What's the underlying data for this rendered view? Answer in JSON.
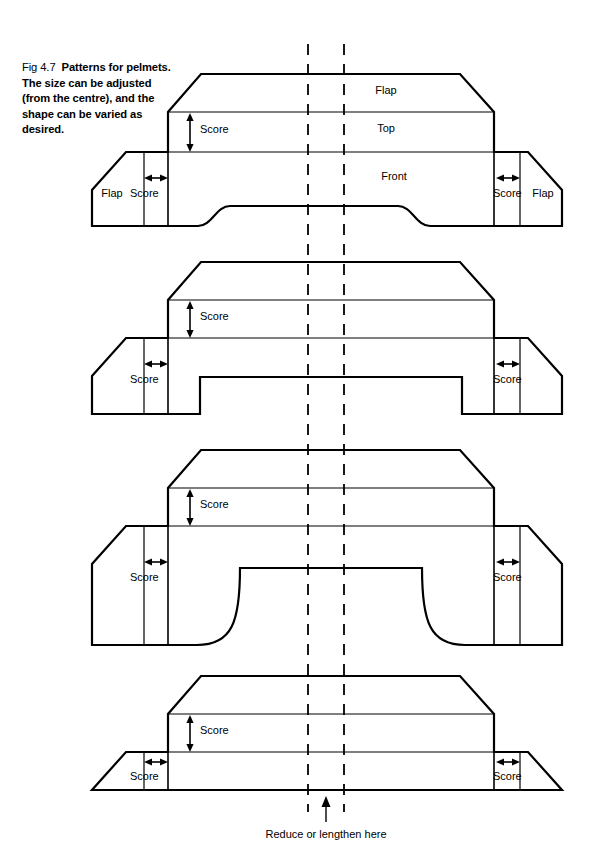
{
  "figure": {
    "number": "Fig 4.7",
    "caption_bold": "Patterns for pelmets. The size can be adjusted (from the centre), and the shape can be varied as desired.",
    "caption_line1": "Patterns for",
    "caption_line2": "pelmets. The size can",
    "caption_line3": "be adjusted (from the",
    "caption_line4": "centre), and the shape",
    "caption_line5": "can be varied as",
    "caption_line6": "desired."
  },
  "labels": {
    "flap": "Flap",
    "top": "Top",
    "front": "Front",
    "score": "Score",
    "bottom_note": "Reduce or lengthen here"
  },
  "colors": {
    "stroke": "#000000",
    "background": "#ffffff",
    "thin_stroke": "#1a1a1a"
  },
  "patterns": [
    {
      "id": "pattern-1",
      "name": "soft-s-curve-pattern",
      "shape_description": "Pelmet pattern with shallow S-curve lower edge",
      "annotated": true,
      "region_labels": [
        "Flap",
        "Top",
        "Front",
        "Score"
      ]
    },
    {
      "id": "pattern-2",
      "name": "stepped-pattern",
      "shape_description": "Pelmet pattern with square stepped lower edge",
      "annotated": false,
      "region_labels": [
        "Score"
      ]
    },
    {
      "id": "pattern-3",
      "name": "deep-concave-curve-pattern",
      "shape_description": "Pelmet pattern with deep concave quarter-circle lower edge",
      "annotated": false,
      "region_labels": [
        "Score"
      ]
    },
    {
      "id": "pattern-4",
      "name": "straight-edge-triangular-flap-pattern",
      "shape_description": "Pelmet pattern with straight lower edge and triangular side flaps",
      "annotated": false,
      "region_labels": [
        "Score"
      ]
    }
  ],
  "centre_guides": {
    "name": "adjustment-guide-lines",
    "left_x": 308,
    "right_x": 344,
    "style": "dashed"
  }
}
